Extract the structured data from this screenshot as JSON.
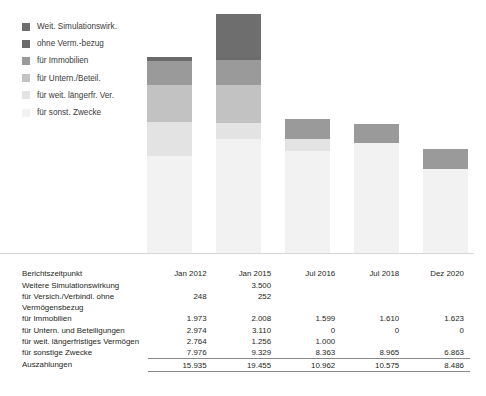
{
  "legend": {
    "items": [
      {
        "label": "Weit. Simulationswirk.",
        "color": "#6e6e6e",
        "key": "weitere_sim"
      },
      {
        "label": "ohne Verm.-bezug",
        "color": "#6b6b6b",
        "key": "ohne_verm_bezug"
      },
      {
        "label": "für Immobilien",
        "color": "#9a9a9a",
        "key": "immobilien"
      },
      {
        "label": "für Untern./Beteil.",
        "color": "#c2c2c2",
        "key": "untern_beteil"
      },
      {
        "label": "für weit. längerfr. Ver.",
        "color": "#e3e3e3",
        "key": "weit_langerfr"
      },
      {
        "label": "für sonst. Zwecke",
        "color": "#f2f2f2",
        "key": "sonst_zwecke"
      }
    ]
  },
  "chart_data": {
    "type": "bar",
    "stacked": true,
    "title": "",
    "xlabel": "",
    "ylabel": "",
    "grid": false,
    "legend_position": "top-left",
    "categories": [
      "Jan 2012",
      "Jan 2015",
      "Jul 2016",
      "Jul 2018",
      "Dez 2020"
    ],
    "ylim": [
      0,
      19455
    ],
    "series": [
      {
        "name": "für sonst. Zwecke",
        "key": "sonst_zwecke",
        "color": "#f2f2f2",
        "values": [
          7976,
          9329,
          8363,
          8965,
          6863
        ]
      },
      {
        "name": "für weit. längerfr. Ver.",
        "key": "weit_langerfr",
        "color": "#e3e3e3",
        "values": [
          2764,
          1256,
          1000,
          null,
          null
        ]
      },
      {
        "name": "für Untern./Beteil.",
        "key": "untern_beteil",
        "color": "#c2c2c2",
        "values": [
          2974,
          3110,
          0,
          0,
          0
        ]
      },
      {
        "name": "für Immobilien",
        "key": "immobilien",
        "color": "#9a9a9a",
        "values": [
          1973,
          2008,
          1599,
          1610,
          1623
        ]
      },
      {
        "name": "ohne Verm.-bezug",
        "key": "ohne_verm_bezug",
        "color": "#6b6b6b",
        "values": [
          248,
          252,
          null,
          null,
          null
        ]
      },
      {
        "name": "Weit. Simulationswirk.",
        "key": "weitere_sim",
        "color": "#6e6e6e",
        "values": [
          null,
          3500,
          null,
          null,
          null
        ]
      }
    ],
    "totals": [
      15935,
      19455,
      10962,
      10575,
      8486
    ]
  },
  "table": {
    "header": {
      "label": "Berichtszeitpunkt",
      "columns": [
        "Jan 2012",
        "Jan 2015",
        "Jul 2016",
        "Jul 2018",
        "Dez 2020"
      ]
    },
    "rows": [
      {
        "label": "Weitere Simulationswirkung",
        "values": [
          "",
          "3.500",
          "",
          "",
          ""
        ]
      },
      {
        "label": "für Versich./Verbindl. ohne",
        "label2": "Vermögensbezug",
        "values": [
          "248",
          "252",
          "",
          "",
          ""
        ]
      },
      {
        "label": "für Immobilien",
        "values": [
          "1.973",
          "2.008",
          "1.599",
          "1.610",
          "1.623"
        ]
      },
      {
        "label": "für Untern. und Beteiligungen",
        "values": [
          "2.974",
          "3.110",
          "0",
          "0",
          "0"
        ]
      },
      {
        "label": "für weit. längerfristiges Vermögen",
        "values": [
          "2.764",
          "1.256",
          "1.000",
          "",
          ""
        ]
      },
      {
        "label": "für sonstige Zwecke",
        "values": [
          "7.976",
          "9.329",
          "8.363",
          "8.965",
          "6.863"
        ]
      }
    ],
    "total_row": {
      "label": "Auszahlungen",
      "values": [
        "15.935",
        "19.455",
        "10.962",
        "10.575",
        "8.486"
      ]
    }
  }
}
